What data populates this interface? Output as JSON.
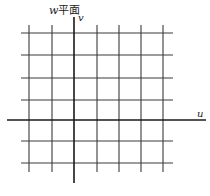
{
  "title": "w平面",
  "title_var": "w",
  "title_suffix": "平面",
  "axes": {
    "horizontal_label": "u",
    "vertical_label": "v"
  },
  "grid": {
    "vertical_lines_x": [
      29,
      52,
      97,
      119,
      141,
      163
    ],
    "horizontal_lines_y": [
      33,
      55,
      78,
      100,
      141,
      163
    ],
    "x_extent": [
      21,
      173
    ],
    "y_extent": [
      25,
      172
    ]
  },
  "axis_geometry": {
    "u_axis": {
      "y": 120,
      "x1": 7,
      "x2": 206
    },
    "v_axis": {
      "x": 74,
      "y1": 17,
      "y2": 183
    }
  },
  "colors": {
    "grid": "#3a3a3a",
    "axis": "#1a1a1a",
    "background": "#ffffff"
  }
}
